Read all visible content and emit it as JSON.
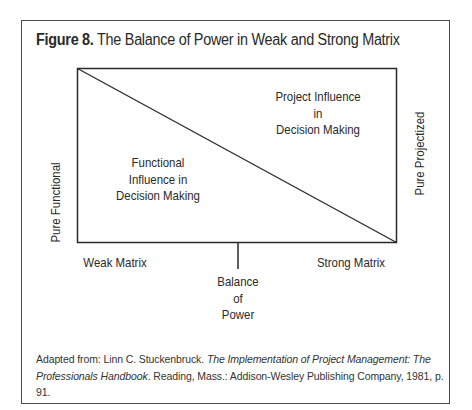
{
  "figure": {
    "number_label": "Figure 8.",
    "title": "The Balance of Power in Weak and Strong Matrix"
  },
  "diagram": {
    "left_axis_label": "Pure Functional",
    "right_axis_label": "Pure Projectized",
    "regions": {
      "functional": {
        "lines": [
          "Functional",
          "Influence in",
          "Decision Making"
        ]
      },
      "project": {
        "lines": [
          "Project Influence",
          "in",
          "Decision Making"
        ]
      }
    },
    "bottom_labels": {
      "left": "Weak Matrix",
      "right": "Strong Matrix",
      "center": [
        "Balance",
        "of",
        "Power"
      ]
    },
    "colors": {
      "line": "#2a2a2a",
      "frame": "#4a4a4a",
      "text": "#2a2a2a"
    }
  },
  "caption": {
    "prefix": "Adapted from: Linn C. Stuckenbruck. ",
    "book_title_part1": "The Implementation of Project Management:",
    "book_title_part2": "The Professionals Handbook",
    "suffix": ". Reading, Mass.: Addison-Wesley Publishing Company, 1981, p. 91."
  }
}
